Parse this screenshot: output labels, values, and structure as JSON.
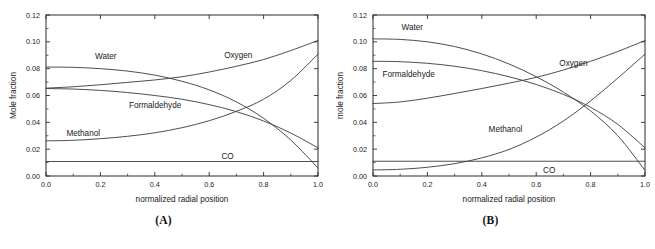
{
  "figure": {
    "panels": [
      {
        "caption": "(A)",
        "ylabel": "Mole fraction",
        "xlabel": "normalized radial position"
      },
      {
        "caption": "(B)",
        "ylabel": "mole fraction",
        "xlabel": "normalized radial position"
      }
    ],
    "xticks": [
      "0.0",
      "0.2",
      "0.4",
      "0.6",
      "0.8",
      "1.0"
    ],
    "yticks": [
      "0.00",
      "0.02",
      "0.04",
      "0.06",
      "0.08",
      "0.10",
      "0.12"
    ]
  },
  "chart_data": [
    {
      "type": "line",
      "title": "(A)",
      "xlabel": "normalized radial position",
      "ylabel": "Mole fraction",
      "xlim": [
        0.0,
        1.0
      ],
      "ylim": [
        0.0,
        0.12
      ],
      "xticks": [
        0.0,
        0.2,
        0.4,
        0.6,
        0.8,
        1.0
      ],
      "yticks": [
        0.0,
        0.02,
        0.04,
        0.06,
        0.08,
        0.1,
        0.12
      ],
      "grid": false,
      "legend": "inline-labels",
      "x": [
        0.0,
        0.1,
        0.2,
        0.3,
        0.4,
        0.5,
        0.6,
        0.7,
        0.8,
        0.9,
        1.0
      ],
      "series": [
        {
          "name": "Water",
          "label": "Water",
          "label_x": 0.18,
          "label_y": 0.0895,
          "values": [
            0.0812,
            0.081,
            0.08,
            0.0782,
            0.0752,
            0.0706,
            0.0642,
            0.0552,
            0.043,
            0.0268,
            0.006
          ]
        },
        {
          "name": "Oxygen",
          "label": "Oxygen",
          "label_x": 0.655,
          "label_y": 0.0905,
          "values": [
            0.0655,
            0.0665,
            0.068,
            0.0698,
            0.0716,
            0.074,
            0.0775,
            0.0818,
            0.0868,
            0.0935,
            0.101
          ]
        },
        {
          "name": "Formaldehyde",
          "label": "Formaldehyde",
          "label_x": 0.305,
          "label_y": 0.053,
          "values": [
            0.0652,
            0.0648,
            0.0638,
            0.0622,
            0.06,
            0.0572,
            0.0532,
            0.048,
            0.041,
            0.032,
            0.021
          ]
        },
        {
          "name": "Methanol",
          "label": "Methanol",
          "label_x": 0.075,
          "label_y": 0.0322,
          "values": [
            0.0262,
            0.0266,
            0.0278,
            0.0296,
            0.0322,
            0.036,
            0.0412,
            0.0482,
            0.0572,
            0.0712,
            0.0908
          ]
        },
        {
          "name": "CO",
          "label": "CO",
          "label_x": 0.645,
          "label_y": 0.0148,
          "values": [
            0.0108,
            0.0108,
            0.0108,
            0.0108,
            0.0108,
            0.0108,
            0.0108,
            0.0108,
            0.0108,
            0.0108,
            0.0108
          ]
        }
      ]
    },
    {
      "type": "line",
      "title": "(B)",
      "xlabel": "normalized radial position",
      "ylabel": "mole fraction",
      "xlim": [
        0.0,
        1.0
      ],
      "ylim": [
        0.0,
        0.12
      ],
      "xticks": [
        0.0,
        0.2,
        0.4,
        0.6,
        0.8,
        1.0
      ],
      "yticks": [
        0.0,
        0.02,
        0.04,
        0.06,
        0.08,
        0.1,
        0.12
      ],
      "grid": false,
      "legend": "inline-labels",
      "x": [
        0.0,
        0.1,
        0.2,
        0.3,
        0.4,
        0.5,
        0.6,
        0.7,
        0.8,
        0.9,
        1.0
      ],
      "series": [
        {
          "name": "Water",
          "label": "Water",
          "label_x": 0.105,
          "label_y": 0.1112,
          "values": [
            0.1022,
            0.1018,
            0.1,
            0.0965,
            0.091,
            0.0835,
            0.074,
            0.0625,
            0.0485,
            0.03,
            0.0042
          ]
        },
        {
          "name": "Formaldehyde",
          "label": "Formaldehyde",
          "label_x": 0.035,
          "label_y": 0.076,
          "values": [
            0.0855,
            0.0852,
            0.084,
            0.0818,
            0.0785,
            0.074,
            0.0682,
            0.0608,
            0.0512,
            0.0385,
            0.021
          ]
        },
        {
          "name": "Oxygen",
          "label": "Oxygen",
          "label_x": 0.685,
          "label_y": 0.0845,
          "values": [
            0.054,
            0.0552,
            0.058,
            0.0615,
            0.0652,
            0.0692,
            0.0735,
            0.079,
            0.0855,
            0.0928,
            0.101
          ]
        },
        {
          "name": "Methanol",
          "label": "Methanol",
          "label_x": 0.425,
          "label_y": 0.0352,
          "values": [
            0.0045,
            0.005,
            0.0065,
            0.0092,
            0.0135,
            0.0198,
            0.029,
            0.041,
            0.056,
            0.073,
            0.0908
          ]
        },
        {
          "name": "CO",
          "label": "CO",
          "label_x": 0.625,
          "label_y": 0.0048,
          "values": [
            0.011,
            0.011,
            0.011,
            0.011,
            0.011,
            0.011,
            0.011,
            0.011,
            0.011,
            0.011,
            0.011
          ]
        }
      ]
    }
  ]
}
